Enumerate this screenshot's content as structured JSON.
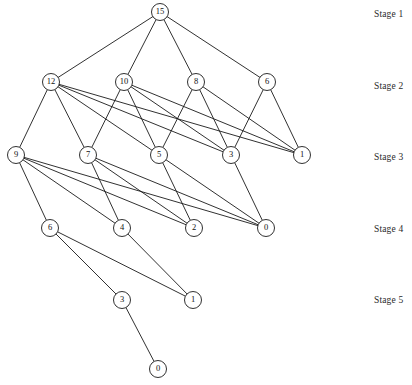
{
  "diagram": {
    "type": "layered-dag",
    "canvas": {
      "width": 412,
      "height": 385
    },
    "node_radius": 8.5,
    "colors": {
      "edge": "#1a1a1a",
      "node_stroke": "#1a1a1a",
      "node_fill": "#ffffff",
      "label_text": "#111111",
      "stage_text": "#2b2b2b",
      "background": "#ffffff"
    },
    "stage_labels": [
      {
        "id": "stage-1",
        "text": "Stage 1",
        "x": 374,
        "y": 9
      },
      {
        "id": "stage-2",
        "text": "Stage 2",
        "x": 374,
        "y": 81
      },
      {
        "id": "stage-3",
        "text": "Stage 3",
        "x": 374,
        "y": 152
      },
      {
        "id": "stage-4",
        "text": "Stage 4",
        "x": 374,
        "y": 224
      },
      {
        "id": "stage-5",
        "text": "Stage 5",
        "x": 374,
        "y": 295
      }
    ],
    "nodes": [
      {
        "id": "n1-15",
        "label": "15",
        "stage": 1,
        "x": 160,
        "y": 12
      },
      {
        "id": "n2-12",
        "label": "12",
        "stage": 2,
        "x": 51,
        "y": 82
      },
      {
        "id": "n2-10",
        "label": "10",
        "stage": 2,
        "x": 124,
        "y": 82
      },
      {
        "id": "n2-8",
        "label": "8",
        "stage": 2,
        "x": 196,
        "y": 82
      },
      {
        "id": "n2-6",
        "label": "6",
        "stage": 2,
        "x": 267,
        "y": 82
      },
      {
        "id": "n3-9",
        "label": "9",
        "stage": 3,
        "x": 16,
        "y": 155
      },
      {
        "id": "n3-7",
        "label": "7",
        "stage": 3,
        "x": 88,
        "y": 155
      },
      {
        "id": "n3-5",
        "label": "5",
        "stage": 3,
        "x": 159,
        "y": 155
      },
      {
        "id": "n3-3",
        "label": "3",
        "stage": 3,
        "x": 231,
        "y": 155
      },
      {
        "id": "n3-1",
        "label": "1",
        "stage": 3,
        "x": 302,
        "y": 155
      },
      {
        "id": "n4-6",
        "label": "6",
        "stage": 4,
        "x": 50,
        "y": 228
      },
      {
        "id": "n4-4",
        "label": "4",
        "stage": 4,
        "x": 122,
        "y": 228
      },
      {
        "id": "n4-2",
        "label": "2",
        "stage": 4,
        "x": 194,
        "y": 228
      },
      {
        "id": "n4-0",
        "label": "0",
        "stage": 4,
        "x": 266,
        "y": 228
      },
      {
        "id": "n5-3",
        "label": "3",
        "stage": 5,
        "x": 122,
        "y": 300
      },
      {
        "id": "n5-1",
        "label": "1",
        "stage": 5,
        "x": 193,
        "y": 300
      },
      {
        "id": "n6-0",
        "label": "0",
        "stage": 6,
        "x": 158,
        "y": 369
      }
    ],
    "edges": [
      {
        "from": "n1-15",
        "to": "n2-12"
      },
      {
        "from": "n1-15",
        "to": "n2-10"
      },
      {
        "from": "n1-15",
        "to": "n2-8"
      },
      {
        "from": "n1-15",
        "to": "n2-6"
      },
      {
        "from": "n2-12",
        "to": "n3-9"
      },
      {
        "from": "n2-12",
        "to": "n3-7"
      },
      {
        "from": "n2-12",
        "to": "n3-5"
      },
      {
        "from": "n2-12",
        "to": "n3-3"
      },
      {
        "from": "n2-12",
        "to": "n3-1"
      },
      {
        "from": "n2-10",
        "to": "n3-7"
      },
      {
        "from": "n2-10",
        "to": "n3-5"
      },
      {
        "from": "n2-10",
        "to": "n3-3"
      },
      {
        "from": "n2-10",
        "to": "n3-1"
      },
      {
        "from": "n2-8",
        "to": "n3-5"
      },
      {
        "from": "n2-8",
        "to": "n3-3"
      },
      {
        "from": "n2-8",
        "to": "n3-1"
      },
      {
        "from": "n2-6",
        "to": "n3-3"
      },
      {
        "from": "n2-6",
        "to": "n3-1"
      },
      {
        "from": "n3-9",
        "to": "n4-6"
      },
      {
        "from": "n3-9",
        "to": "n4-4"
      },
      {
        "from": "n3-9",
        "to": "n4-2"
      },
      {
        "from": "n3-9",
        "to": "n4-0"
      },
      {
        "from": "n3-7",
        "to": "n4-4"
      },
      {
        "from": "n3-7",
        "to": "n4-2"
      },
      {
        "from": "n3-7",
        "to": "n4-0"
      },
      {
        "from": "n3-5",
        "to": "n4-2"
      },
      {
        "from": "n3-5",
        "to": "n4-0"
      },
      {
        "from": "n3-3",
        "to": "n4-0"
      },
      {
        "from": "n4-6",
        "to": "n5-3"
      },
      {
        "from": "n4-6",
        "to": "n5-1"
      },
      {
        "from": "n4-4",
        "to": "n5-1"
      },
      {
        "from": "n5-3",
        "to": "n6-0"
      }
    ]
  }
}
